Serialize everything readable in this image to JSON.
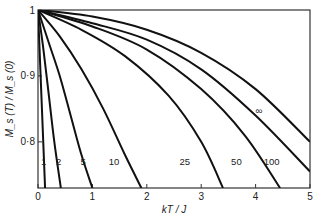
{
  "chart_data": {
    "type": "line",
    "title": "",
    "xlabel": "kT / J",
    "ylabel": "M_s (T) / M_s (0)",
    "xlim": [
      0,
      5
    ],
    "ylim": [
      0.73,
      1.0
    ],
    "xticks": [
      "0",
      "1",
      "2",
      "3",
      "4",
      "5"
    ],
    "yticks": [
      "0·8",
      "0·9",
      "1"
    ],
    "grid": false,
    "legend": "inline curve labels",
    "series": [
      {
        "name": "1",
        "x": [
          0,
          0.13
        ],
        "y": [
          1.0,
          0.73
        ]
      },
      {
        "name": "2",
        "x": [
          0,
          0.1,
          0.2,
          0.3,
          0.42
        ],
        "y": [
          1.0,
          0.94,
          0.87,
          0.8,
          0.73
        ]
      },
      {
        "name": "5",
        "x": [
          0,
          0.2,
          0.4,
          0.6,
          0.8,
          1.0
        ],
        "y": [
          1.0,
          0.95,
          0.9,
          0.84,
          0.78,
          0.73
        ]
      },
      {
        "name": "10",
        "x": [
          0,
          0.4,
          0.8,
          1.2,
          1.6,
          1.9
        ],
        "y": [
          1.0,
          0.96,
          0.91,
          0.85,
          0.78,
          0.73
        ]
      },
      {
        "name": "25",
        "x": [
          0,
          0.8,
          1.6,
          2.4,
          3.0,
          3.4
        ],
        "y": [
          1.0,
          0.97,
          0.93,
          0.87,
          0.8,
          0.73
        ]
      },
      {
        "name": "50",
        "x": [
          0,
          1.0,
          2.0,
          3.0,
          3.8,
          4.45
        ],
        "y": [
          1.0,
          0.975,
          0.94,
          0.88,
          0.81,
          0.73
        ]
      },
      {
        "name": "100",
        "x": [
          0,
          1.0,
          2.0,
          3.0,
          4.0,
          5.0
        ],
        "y": [
          1.0,
          0.98,
          0.955,
          0.91,
          0.84,
          0.755
        ]
      },
      {
        "name": "∞",
        "x": [
          0,
          1.0,
          2.0,
          3.0,
          4.0,
          5.0
        ],
        "y": [
          1.0,
          0.99,
          0.97,
          0.935,
          0.88,
          0.8
        ]
      }
    ],
    "labels": [
      {
        "text": "1",
        "x": 0.0,
        "y": 0.765
      },
      {
        "text": "2",
        "x": 0.33,
        "y": 0.765
      },
      {
        "text": "5",
        "x": 0.78,
        "y": 0.765
      },
      {
        "text": "10",
        "x": 1.3,
        "y": 0.765
      },
      {
        "text": "25",
        "x": 2.6,
        "y": 0.765
      },
      {
        "text": "50",
        "x": 3.55,
        "y": 0.765
      },
      {
        "text": "100",
        "x": 4.15,
        "y": 0.765
      },
      {
        "text": "∞",
        "x": 4.0,
        "y": 0.843
      }
    ]
  }
}
